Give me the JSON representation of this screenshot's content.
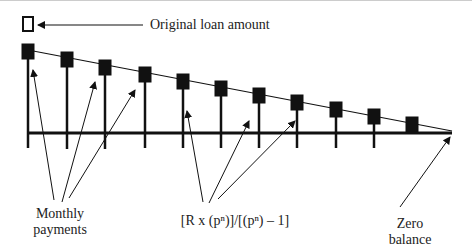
{
  "diagram": {
    "labels": {
      "original_loan": "Original loan amount",
      "monthly_line1": "Monthly",
      "monthly_line2": "payments",
      "formula": "[R x (pⁿ)]/[(pⁿ) – 1]",
      "zero_line1": "Zero",
      "zero_line2": "balance"
    },
    "bars_x": [
      28,
      67,
      105,
      145,
      183,
      221,
      259,
      297,
      336,
      374,
      412
    ],
    "axis_y": 133,
    "colors": {
      "ink": "#111111",
      "background": "#ffffff"
    }
  }
}
